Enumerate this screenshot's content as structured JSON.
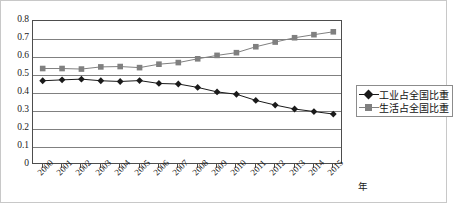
{
  "chart_data": {
    "type": "line",
    "title": "",
    "xlabel": "年",
    "ylabel": "",
    "ylim": [
      0,
      0.8
    ],
    "ytick_labels": [
      "0.8",
      "0.7",
      "0.6",
      "0.5",
      "0.4",
      "0.3",
      "0.2",
      "0.1",
      "0"
    ],
    "ytick_values": [
      0.8,
      0.7,
      0.6,
      0.5,
      0.4,
      0.3,
      0.2,
      0.1,
      0
    ],
    "grid": "horizontal",
    "legend_position": "right",
    "categories": [
      "2000",
      "2001",
      "2002",
      "2003",
      "2004",
      "2005",
      "2006",
      "2007",
      "2008",
      "2009",
      "2010",
      "2011",
      "2012",
      "2013",
      "2014",
      "2015"
    ],
    "series": [
      {
        "name": "工业占全国比重",
        "marker": "diamond",
        "color": "#1a1a1a",
        "values": [
          0.468,
          0.473,
          0.477,
          0.468,
          0.464,
          0.469,
          0.453,
          0.45,
          0.431,
          0.406,
          0.393,
          0.359,
          0.333,
          0.311,
          0.297,
          0.283
        ]
      },
      {
        "name": "生活占全国比重",
        "marker": "square",
        "color": "#808080",
        "values": [
          0.536,
          0.536,
          0.533,
          0.545,
          0.547,
          0.541,
          0.56,
          0.569,
          0.59,
          0.609,
          0.624,
          0.657,
          0.683,
          0.707,
          0.724,
          0.74
        ]
      }
    ]
  },
  "legend": {
    "items": [
      {
        "label": "工业占全国比重",
        "marker": "diamond"
      },
      {
        "label": "生活占全国比重",
        "marker": "square"
      }
    ]
  },
  "axis": {
    "x_title": "年"
  },
  "colors": {
    "series_industry": "#1a1a1a",
    "series_living": "#808080",
    "grid": "#808080",
    "axis": "#4d4d4d",
    "outer_border": "#c8c8c8"
  }
}
